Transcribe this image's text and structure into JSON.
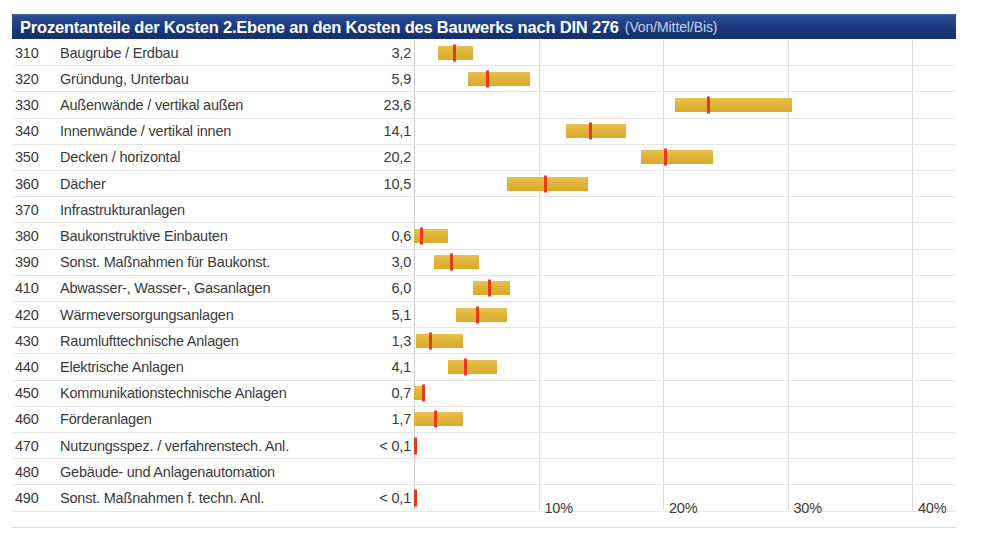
{
  "header": {
    "title_main": "Prozentanteile der Kosten 2.Ebene an den Kosten des Bauwerks nach DIN 276",
    "title_sub": "(Von/Mittel/Bis)",
    "bar_color": "#1d3b7e",
    "text_color": "#ffffff"
  },
  "colors": {
    "range_bar": "#dfb337",
    "mean_marker": "#e8391a",
    "gridline": "#d9d9d9",
    "row_rule": "#e6e6e6",
    "text": "#3a3a3a"
  },
  "chart_data": {
    "type": "bar",
    "title": "Prozentanteile der Kosten 2.Ebene an den Kosten des Bauwerks nach DIN 276 (Von/Mittel/Bis)",
    "subtitle": "(Von/Mittel/Bis)",
    "xlabel": "",
    "ylabel": "",
    "xlim": [
      0,
      42
    ],
    "grid": true,
    "legend": "none",
    "orientation": "horizontal",
    "value_label_note": "Mittelwert in Prozent",
    "xticks": [
      0,
      10,
      20,
      30,
      40
    ],
    "xticklabels": [
      "",
      "10%",
      "20%",
      "30%",
      "40%"
    ],
    "categories": [
      "310 Baugrube / Erdbau",
      "320 Gründung, Unterbau",
      "330 Außenwände / vertikal außen",
      "340 Innenwände / vertikal innen",
      "350 Decken / horizontal",
      "360 Dächer",
      "370 Infrastrukturanlagen",
      "380 Baukonstruktive Einbauten",
      "390 Sonst. Maßnahmen für Baukonst.",
      "410 Abwasser-, Wasser-, Gasanlagen",
      "420 Wärmeversorgungsanlagen",
      "430 Raumlufttechnische Anlagen",
      "440 Elektrische Anlagen",
      "450 Kommunikationstechnische Anlagen",
      "460 Förderanlagen",
      "470 Nutzungsspez. / verfahrenstech. Anl.",
      "480 Gebäude- und Anlagenautomation",
      "490 Sonst. Maßnahmen f. techn. Anl."
    ],
    "series": [
      {
        "name": "Von",
        "values": [
          1.9,
          4.3,
          21.0,
          12.2,
          18.2,
          7.5,
          null,
          0.0,
          1.6,
          4.7,
          3.4,
          0.2,
          2.7,
          0.0,
          0.0,
          null,
          null,
          null
        ]
      },
      {
        "name": "Mittel",
        "values": [
          3.2,
          5.9,
          23.6,
          14.1,
          20.2,
          10.5,
          null,
          0.6,
          3.0,
          6.0,
          5.1,
          1.3,
          4.1,
          0.7,
          1.7,
          0.05,
          null,
          0.05
        ]
      },
      {
        "name": "Bis",
        "values": [
          4.7,
          9.3,
          30.4,
          17.0,
          24.0,
          14.0,
          null,
          2.7,
          5.2,
          7.7,
          7.5,
          3.9,
          6.7,
          0.8,
          3.9,
          null,
          null,
          null
        ]
      }
    ]
  },
  "rows": [
    {
      "code": "310",
      "label": "Baugrube / Erdbau",
      "value": "3,2",
      "von": 1.9,
      "mittel": 3.2,
      "bis": 4.7
    },
    {
      "code": "320",
      "label": "Gründung, Unterbau",
      "value": "5,9",
      "von": 4.3,
      "mittel": 5.9,
      "bis": 9.3
    },
    {
      "code": "330",
      "label": "Außenwände / vertikal außen",
      "value": "23,6",
      "von": 21.0,
      "mittel": 23.6,
      "bis": 30.4
    },
    {
      "code": "340",
      "label": "Innenwände / vertikal innen",
      "value": "14,1",
      "von": 12.2,
      "mittel": 14.1,
      "bis": 17.0
    },
    {
      "code": "350",
      "label": "Decken / horizontal",
      "value": "20,2",
      "von": 18.2,
      "mittel": 20.2,
      "bis": 24.0
    },
    {
      "code": "360",
      "label": "Dächer",
      "value": "10,5",
      "von": 7.5,
      "mittel": 10.5,
      "bis": 14.0
    },
    {
      "code": "370",
      "label": "Infrastrukturanlagen",
      "value": "",
      "von": null,
      "mittel": null,
      "bis": null
    },
    {
      "code": "380",
      "label": "Baukonstruktive Einbauten",
      "value": "0,6",
      "von": 0.0,
      "mittel": 0.6,
      "bis": 2.7
    },
    {
      "code": "390",
      "label": "Sonst. Maßnahmen für Baukonst.",
      "value": "3,0",
      "von": 1.6,
      "mittel": 3.0,
      "bis": 5.2
    },
    {
      "code": "410",
      "label": "Abwasser-, Wasser-, Gasanlagen",
      "value": "6,0",
      "von": 4.7,
      "mittel": 6.0,
      "bis": 7.7
    },
    {
      "code": "420",
      "label": "Wärmeversorgungsanlagen",
      "value": "5,1",
      "von": 3.4,
      "mittel": 5.1,
      "bis": 7.5
    },
    {
      "code": "430",
      "label": "Raumlufttechnische Anlagen",
      "value": "1,3",
      "von": 0.2,
      "mittel": 1.3,
      "bis": 3.9
    },
    {
      "code": "440",
      "label": "Elektrische Anlagen",
      "value": "4,1",
      "von": 2.7,
      "mittel": 4.1,
      "bis": 6.7
    },
    {
      "code": "450",
      "label": "Kommunikationstechnische Anlagen",
      "value": "0,7",
      "von": 0.0,
      "mittel": 0.7,
      "bis": 0.8
    },
    {
      "code": "460",
      "label": "Förderanlagen",
      "value": "1,7",
      "von": 0.0,
      "mittel": 1.7,
      "bis": 3.9
    },
    {
      "code": "470",
      "label": "Nutzungsspez. / verfahrenstech. Anl.",
      "value": "< 0,1",
      "von": null,
      "mittel": 0.05,
      "bis": null
    },
    {
      "code": "480",
      "label": "Gebäude- und Anlagenautomation",
      "value": "",
      "von": null,
      "mittel": null,
      "bis": null
    },
    {
      "code": "490",
      "label": "Sonst. Maßnahmen f. techn. Anl.",
      "value": "< 0,1",
      "von": null,
      "mittel": 0.05,
      "bis": null
    }
  ],
  "axis": {
    "ticks": [
      {
        "value": 10,
        "label": "10%"
      },
      {
        "value": 20,
        "label": "20%"
      },
      {
        "value": 30,
        "label": "30%"
      },
      {
        "value": 40,
        "label": "40%"
      }
    ]
  }
}
